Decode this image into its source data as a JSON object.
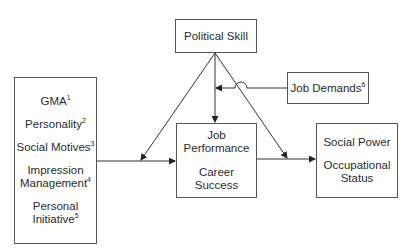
{
  "diagram": {
    "nodes": {
      "political_skill": {
        "label": "Political Skill"
      },
      "job_demands": {
        "label": "Job Demands",
        "sup": "6"
      },
      "antecedents": {
        "items": [
          {
            "label": "GMA",
            "sup": "1"
          },
          {
            "label": "Personality",
            "sup": "2"
          },
          {
            "label": "Social Motives",
            "sup": "3"
          },
          {
            "label": "Impression Management",
            "line1": "Impression",
            "line2": "Management",
            "sup": "4"
          },
          {
            "label": "Personal Initiative",
            "line1": "Personal",
            "line2": "Initiative",
            "sup": "5"
          }
        ]
      },
      "outcomes": {
        "line1": "Job",
        "line2": "Performance",
        "line3": "Career Success"
      },
      "distal_outcomes": {
        "line1": "Social Power",
        "line2": "Occupational",
        "line3": "Status"
      }
    },
    "edges": [
      {
        "from": "antecedents",
        "to": "outcomes",
        "type": "arrow"
      },
      {
        "from": "outcomes",
        "to": "distal_outcomes",
        "type": "arrow"
      },
      {
        "from": "political_skill",
        "to": "antecedents->outcomes",
        "type": "moderation"
      },
      {
        "from": "political_skill",
        "to": "outcomes",
        "type": "arrow"
      },
      {
        "from": "political_skill",
        "to": "outcomes->distal_outcomes",
        "type": "moderation"
      },
      {
        "from": "job_demands",
        "to": "political_skill->outcomes",
        "type": "moderation"
      }
    ]
  }
}
